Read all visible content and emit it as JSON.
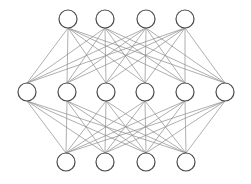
{
  "diagram": {
    "type": "neural-network",
    "width": 251,
    "height": 184,
    "node_radius": 9,
    "colors": {
      "background": "#ffffff",
      "node_stroke": "#4a4a4a",
      "node_fill": "#ffffff",
      "edge": "#8c8c8c"
    },
    "layers": [
      {
        "name": "input-layer",
        "y": 19,
        "x": [
          68,
          105,
          146,
          185
        ]
      },
      {
        "name": "hidden-layer",
        "y": 92,
        "x": [
          27,
          67,
          106,
          145,
          185,
          225
        ]
      },
      {
        "name": "output-layer",
        "y": 162,
        "x": [
          66,
          105,
          146,
          186
        ]
      }
    ],
    "connections": "fully-connected between adjacent layers"
  }
}
